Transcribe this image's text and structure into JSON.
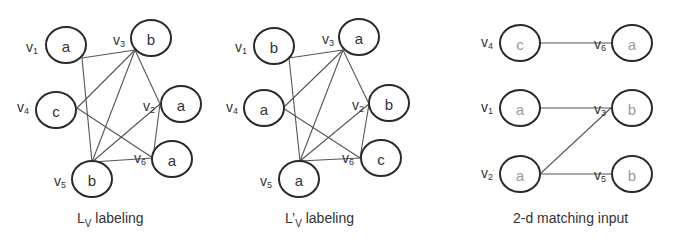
{
  "graphs": [
    {
      "caption": {
        "main": "L",
        "sub": "V",
        "prime": "",
        "rest": " labeling"
      },
      "nodes": [
        {
          "id": "v1",
          "label": "a",
          "name": "v",
          "sub": "1"
        },
        {
          "id": "v3",
          "label": "b",
          "name": "v",
          "sub": "3"
        },
        {
          "id": "v4",
          "label": "c",
          "name": "v",
          "sub": "4"
        },
        {
          "id": "v2",
          "label": "a",
          "name": "v",
          "sub": "2"
        },
        {
          "id": "v6",
          "label": "a",
          "name": "v",
          "sub": "6"
        },
        {
          "id": "v5",
          "label": "b",
          "name": "v",
          "sub": "5"
        }
      ],
      "edges": [
        [
          "v1",
          "v3"
        ],
        [
          "v1",
          "v5"
        ],
        [
          "v4",
          "v3"
        ],
        [
          "v4",
          "v6"
        ],
        [
          "v3",
          "v5"
        ],
        [
          "v3",
          "v2"
        ],
        [
          "v5",
          "v2"
        ],
        [
          "v5",
          "v6"
        ],
        [
          "v2",
          "v6"
        ]
      ]
    },
    {
      "caption": {
        "main": "L",
        "sub": "V",
        "prime": "’",
        "rest": " labeling"
      },
      "nodes": [
        {
          "id": "v1",
          "label": "b",
          "name": "v",
          "sub": "1"
        },
        {
          "id": "v3",
          "label": "a",
          "name": "v",
          "sub": "3"
        },
        {
          "id": "v4",
          "label": "a",
          "name": "v",
          "sub": "4"
        },
        {
          "id": "v2",
          "label": "b",
          "name": "v",
          "sub": "2"
        },
        {
          "id": "v6",
          "label": "c",
          "name": "v",
          "sub": "6"
        },
        {
          "id": "v5",
          "label": "a",
          "name": "v",
          "sub": "5"
        }
      ],
      "edges": [
        [
          "v1",
          "v3"
        ],
        [
          "v1",
          "v5"
        ],
        [
          "v4",
          "v3"
        ],
        [
          "v4",
          "v6"
        ],
        [
          "v3",
          "v5"
        ],
        [
          "v3",
          "v2"
        ],
        [
          "v5",
          "v2"
        ],
        [
          "v5",
          "v6"
        ],
        [
          "v2",
          "v6"
        ]
      ]
    },
    {
      "caption": {
        "main": "2-d matching input"
      },
      "left_nodes": [
        {
          "id": "v4",
          "label": "c",
          "name": "v",
          "sub": "4"
        },
        {
          "id": "v1",
          "label": "a",
          "name": "v",
          "sub": "1"
        },
        {
          "id": "v2",
          "label": "a",
          "name": "v",
          "sub": "2"
        }
      ],
      "right_nodes": [
        {
          "id": "v6",
          "label": "a",
          "name": "v",
          "sub": "6"
        },
        {
          "id": "v3",
          "label": "b",
          "name": "v",
          "sub": "3"
        },
        {
          "id": "v5",
          "label": "b",
          "name": "v",
          "sub": "5"
        }
      ],
      "edges": [
        [
          "v4",
          "v6"
        ],
        [
          "v1",
          "v3"
        ],
        [
          "v2",
          "v3"
        ],
        [
          "v2",
          "v5"
        ]
      ]
    }
  ]
}
